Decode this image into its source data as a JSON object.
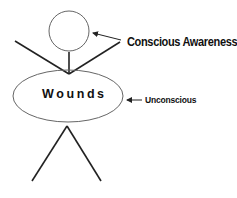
{
  "diagram": {
    "figure": "stick-figure",
    "labels": {
      "head": "Conscious Awareness",
      "body": "Unconscious",
      "body_text": "Wounds"
    },
    "colors": {
      "line": "#222222",
      "outline": "#555555",
      "text": "#111111",
      "background": "#ffffff"
    }
  }
}
